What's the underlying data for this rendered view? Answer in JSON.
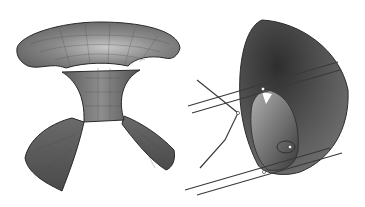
{
  "figure": {
    "panels": [
      {
        "id": "left",
        "subject": "saddle-like minimal surface with flared brim and two lower lobes",
        "has_mesh_grid": true
      },
      {
        "id": "right",
        "subject": "curved shell surface with intersecting line pairs and bent curve"
      }
    ],
    "colors": {
      "background": "#ffffff",
      "surface_dark": "#3c3c3c",
      "surface_mid": "#6e6e6e",
      "surface_light": "#b8b8b8",
      "outline": "#2a2a2a",
      "lines": "#3a3a3a"
    }
  }
}
